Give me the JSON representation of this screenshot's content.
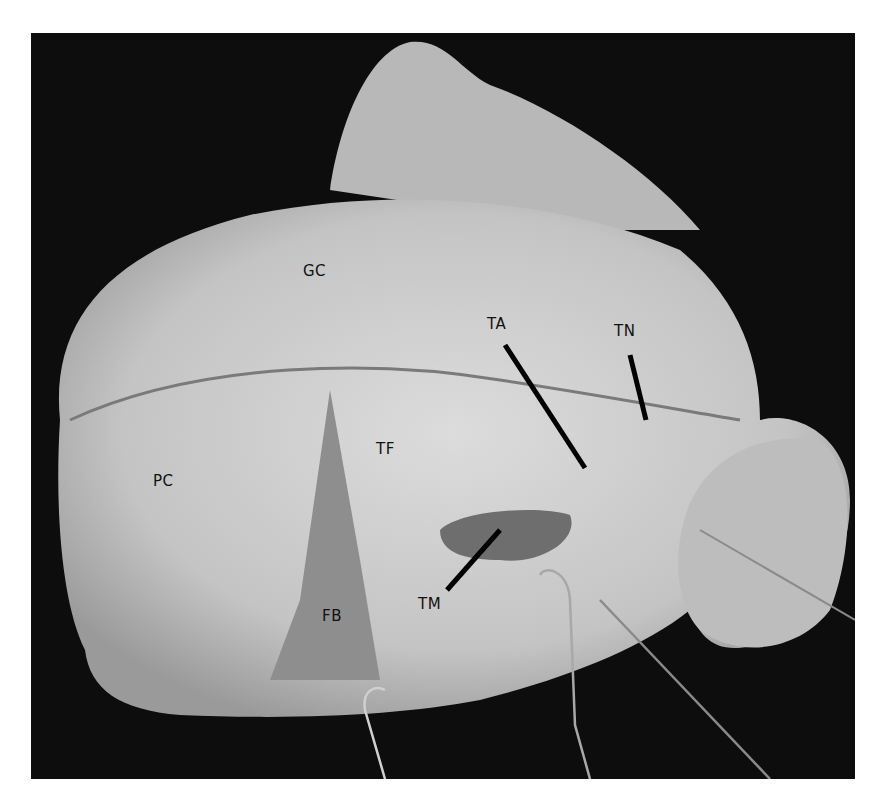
{
  "figure": {
    "labels": [
      {
        "id": "GC",
        "text": "GC",
        "x": 303,
        "y": 262
      },
      {
        "id": "TA",
        "text": "TA",
        "x": 487,
        "y": 315
      },
      {
        "id": "TN",
        "text": "TN",
        "x": 614,
        "y": 322
      },
      {
        "id": "TF",
        "text": "TF",
        "x": 376,
        "y": 440
      },
      {
        "id": "PC",
        "text": "PC",
        "x": 153,
        "y": 472
      },
      {
        "id": "TM",
        "text": "TM",
        "x": 418,
        "y": 595
      },
      {
        "id": "FB",
        "text": "FB",
        "x": 322,
        "y": 607
      }
    ]
  }
}
